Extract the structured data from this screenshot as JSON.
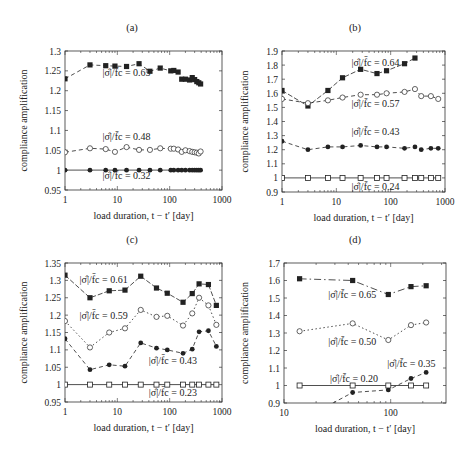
{
  "chart_data": [
    {
      "panel": "(a)",
      "type": "line",
      "xscale": "log",
      "xlim": [
        1,
        1000
      ],
      "ylim": [
        0.95,
        1.3
      ],
      "xticks": [
        1,
        10,
        100,
        1000
      ],
      "xtick_labels": [
        "1",
        "10",
        "100",
        "1000"
      ],
      "yticks": [
        0.95,
        1.0,
        1.05,
        1.1,
        1.15,
        1.2,
        1.25,
        1.3
      ],
      "ytick_labels": [
        "0.95",
        "1",
        "1.05",
        "1.1",
        "1.15",
        "1.2",
        "1.25",
        "1.3"
      ],
      "xlabel": "load duration, t − t′ [day]",
      "ylabel": "compliance amplification",
      "grid": false,
      "series": [
        {
          "name": "|σ̂|/f̄c = 0.65",
          "marker": "filled-square",
          "line": "dashed",
          "x": [
            1,
            3,
            6,
            9,
            15,
            26,
            42,
            66,
            105,
            120,
            145,
            170,
            200,
            240,
            270,
            300,
            330,
            360,
            390
          ],
          "y": [
            1.23,
            1.265,
            1.263,
            1.262,
            1.261,
            1.268,
            1.249,
            1.257,
            1.25,
            1.251,
            1.247,
            1.229,
            1.229,
            1.227,
            1.233,
            1.228,
            1.223,
            1.22,
            1.217
          ]
        },
        {
          "name": "|σ̂|/f̄c = 0.48",
          "marker": "open-circle",
          "line": "dashed",
          "x": [
            1,
            3,
            6,
            9,
            15,
            26,
            42,
            66,
            105,
            120,
            145,
            170,
            200,
            240,
            270,
            300,
            330,
            360,
            390
          ],
          "y": [
            1.045,
            1.055,
            1.053,
            1.046,
            1.058,
            1.051,
            1.051,
            1.055,
            1.054,
            1.054,
            1.052,
            1.046,
            1.05,
            1.048,
            1.046,
            1.045,
            1.044,
            1.042,
            1.047
          ]
        },
        {
          "name": "|σ̂|/f̄c = 0.32",
          "marker": "filled-circle",
          "line": "solid",
          "x": [
            1,
            3,
            6,
            9,
            15,
            26,
            42,
            66,
            105,
            120,
            145,
            170,
            200,
            240,
            270,
            300,
            330,
            360,
            390
          ],
          "y": [
            1.0,
            1.0,
            1.0,
            1.0,
            1.0,
            1.0,
            1.0,
            1.0,
            1.0,
            1.0,
            1.0,
            1.0,
            1.0,
            1.0,
            1.0,
            1.0,
            1.0,
            1.0,
            1.0
          ]
        }
      ],
      "annotations": [
        {
          "text": "|σ̂|/f̄c = 0.65",
          "x": 5.2,
          "y": 1.237
        },
        {
          "text": "|σ̂|/f̄c = 0.48",
          "x": 5.2,
          "y": 1.075
        },
        {
          "text": "|σ̂|/f̄c = 0.32",
          "x": 5.2,
          "y": 0.977
        }
      ]
    },
    {
      "panel": "(b)",
      "type": "line",
      "xscale": "log",
      "xlim": [
        1,
        1000
      ],
      "ylim": [
        0.9,
        1.9
      ],
      "xticks": [
        1,
        10,
        100,
        1000
      ],
      "xtick_labels": [
        "1",
        "10",
        "100",
        "1000"
      ],
      "yticks": [
        0.9,
        1.0,
        1.1,
        1.2,
        1.3,
        1.4,
        1.5,
        1.6,
        1.7,
        1.8,
        1.9
      ],
      "ytick_labels": [
        "0.9",
        "1",
        "1.1",
        "1.2",
        "1.3",
        "1.4",
        "1.5",
        "1.6",
        "1.7",
        "1.8",
        "1.9"
      ],
      "xlabel": "load duration, t − t′ [day]",
      "ylabel": "compliance amplification",
      "grid": false,
      "series": [
        {
          "name": "|σ̂|/f̄c = 0.64",
          "marker": "filled-square",
          "line": "solid-dashed",
          "x": [
            1,
            3,
            7,
            13,
            28,
            56,
            84,
            180,
            280
          ],
          "y": [
            1.62,
            1.51,
            1.62,
            1.71,
            1.77,
            1.74,
            1.76,
            1.81,
            1.85
          ]
        },
        {
          "name": "|σ̂|/f̄c = 0.57",
          "marker": "open-circle",
          "line": "dashed",
          "x": [
            1,
            3,
            7,
            13,
            28,
            56,
            84,
            180,
            280,
            365,
            550,
            750
          ],
          "y": [
            1.56,
            1.53,
            1.55,
            1.57,
            1.59,
            1.59,
            1.6,
            1.61,
            1.63,
            1.58,
            1.58,
            1.56
          ]
        },
        {
          "name": "|σ̂|/f̄c = 0.43",
          "marker": "filled-circle",
          "line": "dashed",
          "x": [
            1,
            3,
            7,
            13,
            28,
            56,
            84,
            180,
            280,
            365,
            550,
            750
          ],
          "y": [
            1.26,
            1.2,
            1.22,
            1.22,
            1.23,
            1.22,
            1.22,
            1.21,
            1.22,
            1.2,
            1.21,
            1.21
          ]
        },
        {
          "name": "|σ̂|/f̄c = 0.24",
          "marker": "open-square",
          "line": "solid",
          "x": [
            1,
            3,
            7,
            13,
            28,
            56,
            84,
            180,
            280,
            365,
            550,
            750
          ],
          "y": [
            1.0,
            1.0,
            1.0,
            1.0,
            1.0,
            1.0,
            1.0,
            1.0,
            1.0,
            1.0,
            1.0,
            1.0
          ]
        }
      ],
      "annotations": [
        {
          "text": "|σ̂|/f̄c = 0.64",
          "x": 19,
          "y": 1.795
        },
        {
          "text": "|σ̂|/f̄c = 0.57",
          "x": 19,
          "y": 1.5
        },
        {
          "text": "|σ̂|/f̄c = 0.43",
          "x": 19,
          "y": 1.305
        },
        {
          "text": "|σ̂|/f̄c = 0.24",
          "x": 19,
          "y": 0.915
        }
      ]
    },
    {
      "panel": "(c)",
      "type": "line",
      "xscale": "log",
      "xlim": [
        1,
        1000
      ],
      "ylim": [
        0.95,
        1.35
      ],
      "xticks": [
        1,
        10,
        100,
        1000
      ],
      "xtick_labels": [
        "1",
        "10",
        "100",
        "1000"
      ],
      "yticks": [
        0.95,
        1.0,
        1.05,
        1.1,
        1.15,
        1.2,
        1.25,
        1.3,
        1.35
      ],
      "ytick_labels": [
        "0.95",
        "1",
        "1.05",
        "1.1",
        "1.15",
        "1.2",
        "1.25",
        "1.3",
        "1.35"
      ],
      "xlabel": "load duration, t − t′ [day]",
      "ylabel": "compliance amplification",
      "grid": false,
      "series": [
        {
          "name": "|σ̂|/f̄c = 0.61",
          "marker": "filled-square",
          "line": "solid-dashed",
          "x": [
            1,
            3,
            7,
            14,
            28,
            56,
            90,
            180,
            270,
            365,
            550,
            780
          ],
          "y": [
            1.315,
            1.25,
            1.27,
            1.272,
            1.312,
            1.278,
            1.263,
            1.237,
            1.262,
            1.29,
            1.288,
            1.228
          ]
        },
        {
          "name": "|σ̂|/f̄c = 0.59",
          "marker": "open-circle",
          "line": "dotted",
          "x": [
            1,
            3,
            7,
            14,
            28,
            56,
            90,
            180,
            270,
            365,
            550,
            780
          ],
          "y": [
            1.183,
            1.107,
            1.15,
            1.162,
            1.215,
            1.195,
            1.198,
            1.17,
            1.205,
            1.25,
            1.228,
            1.172
          ]
        },
        {
          "name": "|σ̂|/f̄c = 0.43",
          "marker": "filled-circle",
          "line": "dashed",
          "x": [
            1,
            3,
            7,
            14,
            28,
            56,
            90,
            180,
            270,
            365,
            550,
            780
          ],
          "y": [
            1.132,
            1.043,
            1.057,
            1.053,
            1.12,
            1.105,
            1.1,
            1.09,
            1.102,
            1.152,
            1.155,
            1.11
          ]
        },
        {
          "name": "|σ̂|/f̄c = 0.23",
          "marker": "open-square",
          "line": "solid",
          "x": [
            1,
            3,
            7,
            14,
            28,
            56,
            90,
            180,
            270,
            365,
            550,
            780
          ],
          "y": [
            1.0,
            1.0,
            1.0,
            1.0,
            1.0,
            1.0,
            1.0,
            1.0,
            1.0,
            1.0,
            1.0,
            1.0
          ]
        }
      ],
      "annotations": [
        {
          "text": "|σ̂|/f̄c = 0.61",
          "x": 1.9,
          "y": 1.293
        },
        {
          "text": "|σ̂|/f̄c = 0.59",
          "x": 1.9,
          "y": 1.19
        },
        {
          "text": "|σ̂|/f̄c = 0.43",
          "x": 40,
          "y": 1.06
        },
        {
          "text": "|σ̂|/f̄c = 0.23",
          "x": 40,
          "y": 0.968
        }
      ]
    },
    {
      "panel": "(d)",
      "type": "line",
      "xscale": "log",
      "xlim": [
        10,
        330
      ],
      "ylim": [
        0.9,
        1.7
      ],
      "xticks": [
        10,
        100
      ],
      "xtick_labels": [
        "10",
        "100"
      ],
      "yticks": [
        0.9,
        1.0,
        1.1,
        1.2,
        1.3,
        1.4,
        1.5,
        1.6,
        1.7
      ],
      "ytick_labels": [
        "0.9",
        "1",
        "1.1",
        "1.2",
        "1.3",
        "1.4",
        "1.5",
        "1.6",
        "1.7"
      ],
      "xlabel": "load duration, t − t′ [day]",
      "ylabel": "compliance amplification",
      "grid": false,
      "series": [
        {
          "name": "|σ̂|/f̄c = 0.65",
          "marker": "filled-square",
          "line": "dash-dot",
          "x": [
            14,
            44,
            95,
            155,
            215
          ],
          "y": [
            1.61,
            1.6,
            1.52,
            1.565,
            1.57
          ]
        },
        {
          "name": "|σ̂|/f̄c = 0.50",
          "marker": "open-circle",
          "line": "dotted",
          "x": [
            14,
            44,
            95,
            155,
            215
          ],
          "y": [
            1.31,
            1.355,
            1.26,
            1.345,
            1.36
          ]
        },
        {
          "name": "|σ̂|/f̄c = 0.35",
          "marker": "filled-circle",
          "line": "dashed",
          "x": [
            25,
            44,
            95,
            155,
            215
          ],
          "y": [
            0.88,
            0.96,
            0.975,
            1.04,
            1.075
          ]
        },
        {
          "name": "|σ̂|/f̄c = 0.20",
          "marker": "open-square",
          "line": "solid",
          "x": [
            14,
            44,
            95,
            155,
            215
          ],
          "y": [
            1.0,
            1.0,
            1.0,
            1.0,
            1.0
          ]
        }
      ],
      "annotations": [
        {
          "text": "|σ̂|/f̄c = 0.65",
          "x": 26,
          "y": 1.5
        },
        {
          "text": "|σ̂|/f̄c = 0.50",
          "x": 26,
          "y": 1.23
        },
        {
          "text": "|σ̂|/f̄c = 0.35",
          "x": 93,
          "y": 1.105
        },
        {
          "text": "|σ̂|/f̄c = 0.20",
          "x": 27,
          "y": 1.02
        }
      ]
    }
  ],
  "panels": [
    {
      "title": "(a)",
      "xlabel": "load duration, t − t′ [day]",
      "ylabel": "compliance amplification"
    },
    {
      "title": "(b)",
      "xlabel": "load duration, t − t′ [day]",
      "ylabel": "compliance amplification"
    },
    {
      "title": "(c)",
      "xlabel": "load duration, t − t′ [day]",
      "ylabel": "compliance amplification"
    },
    {
      "title": "(d)",
      "xlabel": "load duration, t − t′ [day]",
      "ylabel": "compliance amplification"
    }
  ],
  "layout": {
    "frames": [
      {
        "left": 65,
        "top": 51,
        "right": 222,
        "bottom": 190
      },
      {
        "left": 282,
        "top": 51,
        "right": 445,
        "bottom": 192
      },
      {
        "left": 65,
        "top": 263,
        "right": 222,
        "bottom": 402
      },
      {
        "left": 284,
        "top": 263,
        "right": 446,
        "bottom": 403
      }
    ],
    "title_pos": [
      [
        132,
        31
      ],
      [
        355,
        31
      ],
      [
        132,
        243
      ],
      [
        355,
        243
      ]
    ],
    "ylabel_x": [
      27,
      248,
      27,
      248
    ],
    "colors": {
      "axis": "#333333",
      "line": "#222222",
      "text": "#222222",
      "background": "#ffffff"
    }
  }
}
